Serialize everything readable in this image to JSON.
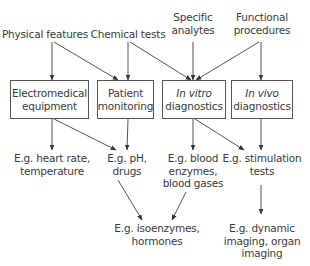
{
  "colors": {
    "line": "#555555",
    "text": "#3a3a3a",
    "background": "#ffffff"
  },
  "sources": [
    {
      "id": "physical",
      "lines": [
        "Physical features"
      ]
    },
    {
      "id": "chemical",
      "lines": [
        "Chemical tests"
      ]
    },
    {
      "id": "specific",
      "lines": [
        "Specific",
        "analytes"
      ]
    },
    {
      "id": "functional",
      "lines": [
        "Functional",
        "procedures"
      ]
    }
  ],
  "boxes": [
    {
      "id": "electromedical",
      "lines": [
        "Electromedical",
        "equipment"
      ]
    },
    {
      "id": "patient",
      "lines": [
        "Patient",
        "monitoring"
      ]
    },
    {
      "id": "invitro",
      "italic_prefix": "In vitro",
      "lines_rest": "diagnostics"
    },
    {
      "id": "invivo",
      "italic_prefix": "In vivo",
      "lines_rest": "diagnostics"
    }
  ],
  "examples": [
    {
      "id": "heart",
      "lines": [
        "E.g. heart rate,",
        "temperature"
      ]
    },
    {
      "id": "ph",
      "lines": [
        "E.g. pH,",
        "drugs"
      ]
    },
    {
      "id": "blood",
      "lines": [
        "E.g. blood",
        "enzymes,",
        "blood gases"
      ]
    },
    {
      "id": "stim",
      "lines": [
        "E.g. stimulation",
        "tests"
      ]
    },
    {
      "id": "iso",
      "lines": [
        "E.g. isoenzymes,",
        "hormones"
      ]
    },
    {
      "id": "imaging",
      "lines": [
        "E.g. dynamic",
        "imaging, organ",
        "imaging"
      ]
    }
  ],
  "edges": [
    {
      "from": "physical",
      "to": "electromedical"
    },
    {
      "from": "physical",
      "to": "patient"
    },
    {
      "from": "chemical",
      "to": "patient"
    },
    {
      "from": "chemical",
      "to": "invitro"
    },
    {
      "from": "specific",
      "to": "invitro"
    },
    {
      "from": "functional",
      "to": "invitro"
    },
    {
      "from": "functional",
      "to": "invivo"
    },
    {
      "from": "electromedical",
      "to": "heart"
    },
    {
      "from": "electromedical",
      "to": "ph"
    },
    {
      "from": "patient",
      "to": "ph"
    },
    {
      "from": "invitro",
      "to": "blood"
    },
    {
      "from": "invitro",
      "to": "stim"
    },
    {
      "from": "invivo",
      "to": "stim"
    },
    {
      "from": "ph",
      "to": "iso"
    },
    {
      "from": "blood",
      "to": "iso"
    },
    {
      "from": "stim",
      "to": "imaging"
    }
  ]
}
